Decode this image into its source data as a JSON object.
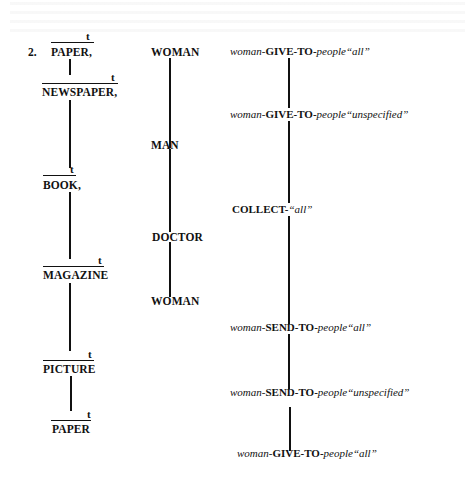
{
  "example_number": "2.",
  "topic_marker": "t",
  "left_column": {
    "items": [
      {
        "label": "PAPER,"
      },
      {
        "label": "NEWSPAPER,"
      },
      {
        "label": "BOOK,"
      },
      {
        "label": "MAGAZINE"
      },
      {
        "label": "PICTURE"
      },
      {
        "label": "PAPER"
      }
    ]
  },
  "middle_column": {
    "items": [
      {
        "label": "WOMAN"
      },
      {
        "label": "MAN"
      },
      {
        "label": "DOCTOR"
      },
      {
        "label": "WOMAN"
      }
    ]
  },
  "right_column": {
    "items": [
      {
        "agent": "woman-",
        "verb": "GIVE-TO-",
        "object": "people",
        "modifier": "“all”"
      },
      {
        "agent": "woman-",
        "verb": "GIVE-TO-",
        "object": "people",
        "modifier": "“unspecified”"
      },
      {
        "agent": "",
        "verb": "COLLECT-",
        "object": "",
        "modifier": "“all”"
      },
      {
        "agent": "woman-",
        "verb": "SEND-TO-",
        "object": "people",
        "modifier": "“all”"
      },
      {
        "agent": "woman-",
        "verb": "SEND-TO-",
        "object": "people",
        "modifier": "“unspecified”"
      },
      {
        "agent": "woman-",
        "verb": "GIVE-TO-",
        "object": "people",
        "modifier": "“all”"
      }
    ]
  }
}
